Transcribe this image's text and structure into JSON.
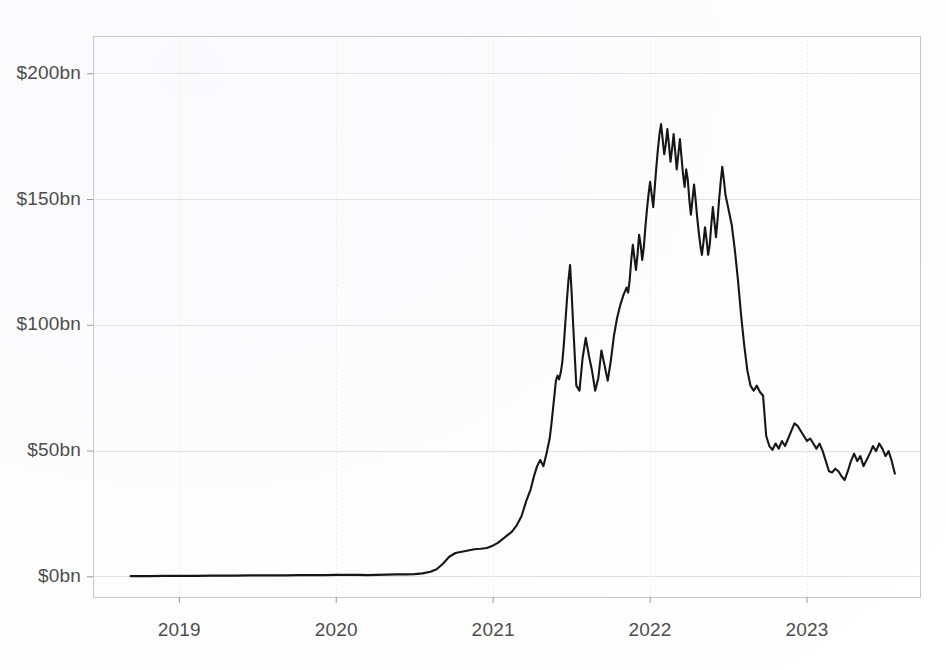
{
  "figure": {
    "background_color": "#ffffff",
    "axis_color": "#c8c8cc",
    "grid_color": "#e2e2e6",
    "line_color": "#161616",
    "tick_label_color": "#4d4d4d"
  },
  "chart_data": {
    "type": "line",
    "title": "",
    "subtitle": "",
    "xlabel": "",
    "ylabel": "",
    "legend": [],
    "legend_position": "none",
    "grid": true,
    "xlim": [
      2018.45,
      2023.72
    ],
    "ylim": [
      -8,
      215
    ],
    "xtick_labels": [
      "2019",
      "2020",
      "2021",
      "2022",
      "2023"
    ],
    "xtick_values": [
      2019,
      2020,
      2021,
      2022,
      2023
    ],
    "ytick_labels": [
      "$0bn",
      "$50bn",
      "$100bn",
      "$150bn",
      "$200bn"
    ],
    "ytick_values": [
      0,
      50,
      100,
      150,
      200
    ],
    "y_unit": "billions of US dollars",
    "series": [
      {
        "name": "Total value",
        "color": "#161616",
        "x": [
          2018.69,
          2018.75,
          2018.82,
          2018.9,
          2018.97,
          2019.05,
          2019.12,
          2019.2,
          2019.28,
          2019.36,
          2019.44,
          2019.52,
          2019.6,
          2019.68,
          2019.76,
          2019.84,
          2019.92,
          2020.0,
          2020.08,
          2020.14,
          2020.2,
          2020.26,
          2020.32,
          2020.38,
          2020.44,
          2020.5,
          2020.55,
          2020.6,
          2020.64,
          2020.68,
          2020.72,
          2020.76,
          2020.8,
          2020.84,
          2020.88,
          2020.92,
          2020.96,
          2021.0,
          2021.03,
          2021.06,
          2021.09,
          2021.12,
          2021.15,
          2021.18,
          2021.21,
          2021.24,
          2021.26,
          2021.28,
          2021.3,
          2021.32,
          2021.34,
          2021.36,
          2021.37,
          2021.38,
          2021.39,
          2021.4,
          2021.41,
          2021.42,
          2021.43,
          2021.44,
          2021.45,
          2021.46,
          2021.47,
          2021.48,
          2021.49,
          2021.5,
          2021.51,
          2021.52,
          2021.53,
          2021.55,
          2021.57,
          2021.59,
          2021.61,
          2021.63,
          2021.65,
          2021.67,
          2021.69,
          2021.71,
          2021.73,
          2021.75,
          2021.77,
          2021.79,
          2021.81,
          2021.83,
          2021.85,
          2021.86,
          2021.87,
          2021.88,
          2021.89,
          2021.9,
          2021.91,
          2021.92,
          2021.93,
          2021.94,
          2021.95,
          2021.96,
          2021.97,
          2021.98,
          2021.99,
          2022.0,
          2022.01,
          2022.02,
          2022.03,
          2022.04,
          2022.05,
          2022.06,
          2022.07,
          2022.08,
          2022.09,
          2022.1,
          2022.11,
          2022.12,
          2022.13,
          2022.14,
          2022.15,
          2022.16,
          2022.17,
          2022.18,
          2022.19,
          2022.2,
          2022.21,
          2022.22,
          2022.23,
          2022.24,
          2022.25,
          2022.26,
          2022.27,
          2022.28,
          2022.29,
          2022.3,
          2022.31,
          2022.32,
          2022.33,
          2022.34,
          2022.35,
          2022.36,
          2022.37,
          2022.38,
          2022.39,
          2022.4,
          2022.41,
          2022.42,
          2022.43,
          2022.44,
          2022.45,
          2022.46,
          2022.47,
          2022.48,
          2022.5,
          2022.52,
          2022.54,
          2022.56,
          2022.58,
          2022.6,
          2022.62,
          2022.64,
          2022.66,
          2022.68,
          2022.7,
          2022.72,
          2022.74,
          2022.76,
          2022.78,
          2022.8,
          2022.82,
          2022.84,
          2022.86,
          2022.88,
          2022.9,
          2022.92,
          2022.94,
          2022.96,
          2022.98,
          2023.0,
          2023.02,
          2023.04,
          2023.06,
          2023.08,
          2023.1,
          2023.12,
          2023.14,
          2023.16,
          2023.18,
          2023.2,
          2023.22,
          2023.24,
          2023.26,
          2023.28,
          2023.3,
          2023.32,
          2023.34,
          2023.36,
          2023.38,
          2023.4,
          2023.42,
          2023.44,
          2023.46,
          2023.48,
          2023.5,
          2023.52,
          2023.54,
          2023.56
        ],
        "y": [
          0.3,
          0.3,
          0.3,
          0.4,
          0.4,
          0.4,
          0.4,
          0.5,
          0.5,
          0.5,
          0.6,
          0.6,
          0.6,
          0.6,
          0.7,
          0.7,
          0.7,
          0.8,
          0.8,
          0.8,
          0.7,
          0.8,
          0.9,
          1.0,
          1.0,
          1.1,
          1.4,
          2.0,
          3.0,
          5.2,
          8.0,
          9.5,
          10.0,
          10.5,
          11.0,
          11.2,
          11.5,
          12.5,
          13.5,
          15.0,
          16.5,
          18.0,
          20.5,
          24.0,
          30.0,
          35.0,
          40.0,
          44.0,
          46.5,
          44.0,
          49.0,
          55.0,
          60.0,
          66.0,
          72.0,
          78.0,
          80.0,
          78.5,
          81.0,
          85.0,
          92.0,
          101.0,
          110.0,
          118.0,
          124.0,
          113.0,
          100.0,
          88.0,
          76.0,
          74.0,
          87.0,
          95.0,
          88.0,
          82.0,
          74.0,
          79.0,
          90.0,
          84.0,
          78.0,
          86.0,
          96.0,
          103.0,
          108.0,
          112.0,
          115.0,
          113.0,
          118.0,
          126.0,
          132.0,
          127.0,
          122.0,
          128.0,
          136.0,
          132.0,
          126.0,
          131.0,
          139.0,
          146.0,
          152.0,
          157.0,
          152.0,
          147.0,
          155.0,
          163.0,
          170.0,
          176.0,
          180.0,
          174.0,
          168.0,
          172.0,
          178.0,
          172.0,
          165.0,
          170.0,
          176.0,
          169.0,
          162.0,
          168.0,
          174.0,
          167.0,
          160.0,
          155.0,
          162.0,
          158.0,
          150.0,
          144.0,
          150.0,
          156.0,
          150.0,
          143.0,
          137.0,
          132.0,
          128.0,
          133.0,
          139.0,
          134.0,
          128.0,
          132.0,
          140.0,
          147.0,
          141.0,
          135.0,
          142.0,
          150.0,
          157.0,
          163.0,
          158.0,
          152.0,
          146.0,
          140.0,
          130.0,
          118.0,
          104.0,
          92.0,
          82.0,
          76.0,
          74.0,
          76.0,
          73.5,
          72.0,
          56.0,
          52.0,
          50.5,
          53.0,
          51.0,
          54.0,
          52.0,
          55.0,
          58.0,
          61.0,
          60.0,
          58.0,
          56.0,
          54.0,
          55.0,
          53.0,
          51.0,
          53.0,
          50.0,
          46.0,
          42.0,
          41.5,
          43.0,
          42.0,
          40.0,
          38.5,
          42.0,
          46.0,
          49.0,
          46.0,
          48.0,
          44.0,
          46.5,
          49.0,
          52.0,
          50.0,
          53.0,
          51.0,
          48.0,
          50.0,
          46.0,
          41.0
        ]
      }
    ],
    "annotations": {
      "peak_value": 180,
      "peak_x": "late 2021",
      "trough_before_rise": 0.3,
      "final_value": 41
    }
  }
}
